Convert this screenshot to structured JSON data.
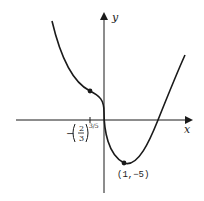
{
  "figure": {
    "type": "function-graph",
    "axes": {
      "x_label": "x",
      "y_label": "y"
    },
    "points": [
      {
        "name": "inflection",
        "label_prefix": "−",
        "fraction_numerator": "2",
        "fraction_denominator": "3",
        "exponent": "3/5"
      },
      {
        "name": "minimum",
        "label": "(1,−5)"
      }
    ],
    "colors": {
      "ink": "#1a1a1a",
      "background": "#ffffff"
    }
  }
}
